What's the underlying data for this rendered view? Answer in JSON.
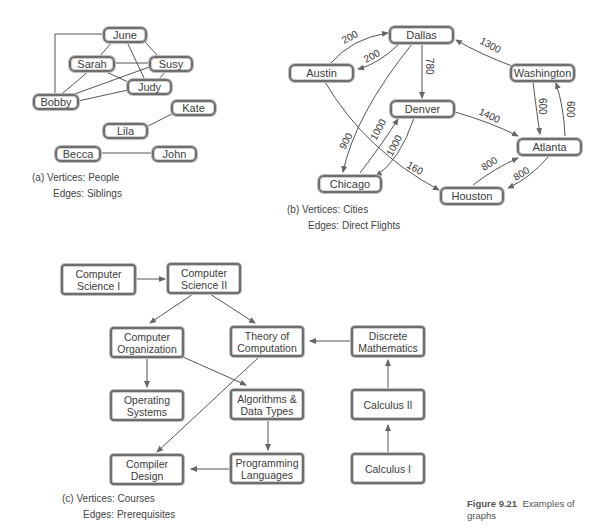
{
  "figure": {
    "number": "Figure 9.21",
    "title": "Examples of graphs"
  },
  "graph_a": {
    "caption_letter": "(a)",
    "vertices_label": "Vertices: People",
    "edges_label": "Edges: Siblings",
    "nodes": {
      "june": "June",
      "sarah": "Sarah",
      "susy": "Susy",
      "judy": "Judy",
      "bobby": "Bobby",
      "kate": "Kate",
      "lila": "Lila",
      "becca": "Becca",
      "john": "John"
    },
    "edges": [
      [
        "June",
        "Bobby"
      ],
      [
        "June",
        "Sarah"
      ],
      [
        "June",
        "Susy"
      ],
      [
        "June",
        "Judy"
      ],
      [
        "Sarah",
        "Susy"
      ],
      [
        "Sarah",
        "Judy"
      ],
      [
        "Sarah",
        "Bobby"
      ],
      [
        "Susy",
        "Judy"
      ],
      [
        "Susy",
        "Bobby"
      ],
      [
        "Judy",
        "Bobby"
      ],
      [
        "Lila",
        "Kate"
      ],
      [
        "Becca",
        "John"
      ]
    ]
  },
  "graph_b": {
    "caption_letter": "(b)",
    "vertices_label": "Vertices: Cities",
    "edges_label": "Edges: Direct Flights",
    "nodes": {
      "dallas": "Dallas",
      "austin": "Austin",
      "washington": "Washington",
      "denver": "Denver",
      "atlanta": "Atlanta",
      "chicago": "Chicago",
      "houston": "Houston"
    },
    "edge_labels": {
      "austin_dallas": "200",
      "dallas_austin": "200",
      "dallas_denver": "780",
      "washington_dallas": "1300",
      "dallas_chicago": "900",
      "chicago_denver": "1000",
      "denver_chicago": "1000",
      "austin_houston": "160",
      "denver_atlanta": "1400",
      "washington_atlanta": "600",
      "atlanta_washington": "600",
      "houston_atlanta": "800",
      "atlanta_houston": "800"
    }
  },
  "graph_c": {
    "caption_letter": "(c)",
    "vertices_label": "Vertices: Courses",
    "edges_label": "Edges: Prerequisites",
    "nodes": {
      "cs1": "Computer\nScience I",
      "cs2": "Computer\nScience II",
      "org": "Computer\nOrganization",
      "toc": "Theory of\nComputation",
      "discrete": "Discrete\nMathematics",
      "os": "Operating\nSystems",
      "algo": "Algorithms &\nData Types",
      "calc2": "Calculus II",
      "compiler": "Compiler\nDesign",
      "proglang": "Programming\nLanguages",
      "calc1": "Calculus I"
    },
    "edges": [
      [
        "Computer Science I",
        "Computer Science II"
      ],
      [
        "Computer Science II",
        "Computer Organization"
      ],
      [
        "Computer Science II",
        "Theory of Computation"
      ],
      [
        "Computer Organization",
        "Operating Systems"
      ],
      [
        "Computer Organization",
        "Algorithms & Data Types"
      ],
      [
        "Theory of Computation",
        "Compiler Design"
      ],
      [
        "Discrete Mathematics",
        "Theory of Computation"
      ],
      [
        "Algorithms & Data Types",
        "Programming Languages"
      ],
      [
        "Programming Languages",
        "Compiler Design"
      ],
      [
        "Calculus I",
        "Calculus II"
      ],
      [
        "Calculus II",
        "Discrete Mathematics"
      ]
    ]
  }
}
